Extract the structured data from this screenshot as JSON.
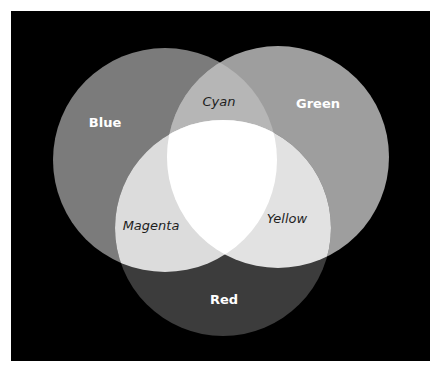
{
  "caption": {
    "text_partially_visible": ""
  },
  "diagram": {
    "type": "venn",
    "background": "#000000",
    "circles": [
      {
        "name": "Blue",
        "cx": 154,
        "cy": 149,
        "r": 112,
        "fill": "#7b7b7b"
      },
      {
        "name": "Green",
        "cx": 267,
        "cy": 146,
        "r": 111,
        "fill": "#9e9e9e"
      },
      {
        "name": "Red",
        "cx": 212,
        "cy": 217,
        "r": 108,
        "fill": "#3c3c3c"
      }
    ],
    "overlap_colors": {
      "blue_green": "#b6b6b6",
      "blue_red": "#dcdcdc",
      "green_red": "#e2e2e2",
      "all": "#ffffff"
    },
    "labels": {
      "blue": "Blue",
      "green": "Green",
      "red": "Red",
      "cyan": "Cyan",
      "magenta": "Magenta",
      "yellow": "Yellow"
    }
  }
}
